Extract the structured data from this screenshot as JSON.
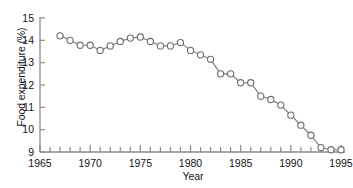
{
  "chart_data": {
    "type": "line",
    "title": "",
    "xlabel": "Year",
    "ylabel": "Food expenditure (%)",
    "xlim": [
      1965,
      1995
    ],
    "ylim": [
      9,
      15
    ],
    "grid": false,
    "legend": null,
    "marker": "open-circle",
    "line_color": "#7a7a7a",
    "marker_edge_color": "#6e6e6e",
    "marker_face_color": "#ffffff",
    "x_ticks_major": [
      1965,
      1970,
      1975,
      1980,
      1985,
      1990,
      1995
    ],
    "x_tick_labels": [
      "1965",
      "1970",
      "1975",
      "1980",
      "1985",
      "1990",
      "1995"
    ],
    "x_minor_tick_step": 1,
    "y_ticks": [
      9,
      10,
      11,
      12,
      13,
      14,
      15
    ],
    "y_tick_labels": [
      "9",
      "10",
      "11",
      "12",
      "13",
      "14",
      "15"
    ],
    "x": [
      1967,
      1968,
      1969,
      1970,
      1971,
      1972,
      1973,
      1974,
      1975,
      1976,
      1977,
      1978,
      1979,
      1980,
      1981,
      1982,
      1983,
      1984,
      1985,
      1986,
      1987,
      1988,
      1989,
      1990,
      1991,
      1992,
      1993,
      1994,
      1995
    ],
    "values": [
      14.2,
      14.0,
      13.78,
      13.78,
      13.55,
      13.75,
      13.95,
      14.1,
      14.15,
      13.95,
      13.75,
      13.75,
      13.9,
      13.55,
      13.35,
      13.15,
      12.5,
      12.5,
      12.1,
      12.1,
      11.5,
      11.35,
      11.1,
      10.65,
      10.2,
      9.75,
      9.2,
      9.1,
      9.1
    ],
    "series": [
      {
        "name": "Food expenditure",
        "values": [
          14.2,
          14.0,
          13.78,
          13.78,
          13.55,
          13.75,
          13.95,
          14.1,
          14.15,
          13.95,
          13.75,
          13.75,
          13.9,
          13.55,
          13.35,
          13.15,
          12.5,
          12.5,
          12.1,
          12.1,
          11.5,
          11.35,
          11.1,
          10.65,
          10.2,
          9.75,
          9.2,
          9.1,
          9.1
        ]
      }
    ]
  },
  "axes": {
    "y_title": "Food expenditure (%)",
    "x_title": "Year"
  }
}
